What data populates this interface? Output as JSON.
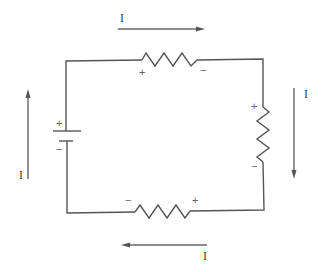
{
  "diagram": {
    "type": "series circuit",
    "battery": {
      "positive_label": "+",
      "negative_label": "−"
    },
    "resistors": [
      {
        "position": "top",
        "left_label": "+",
        "right_label": "−"
      },
      {
        "position": "right",
        "top_label": "+",
        "bottom_label": "−"
      },
      {
        "position": "bottom",
        "left_label": "−",
        "right_label": "+"
      }
    ],
    "currents": [
      {
        "position": "top",
        "label": "I",
        "direction": "right"
      },
      {
        "position": "right",
        "label": "I",
        "direction": "down"
      },
      {
        "position": "bottom",
        "label": "I",
        "direction": "left"
      },
      {
        "position": "left",
        "label": "I",
        "direction": "up"
      }
    ],
    "colors": {
      "wire": "#555555",
      "arrow": "#666666",
      "text": "#444444"
    }
  }
}
